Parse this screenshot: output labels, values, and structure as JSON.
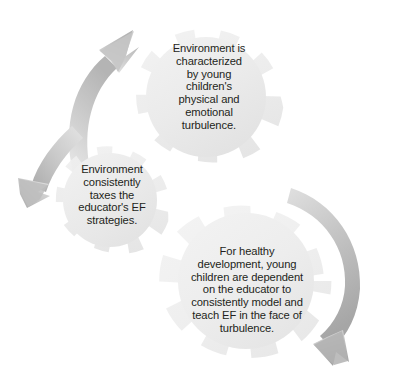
{
  "diagram": {
    "type": "cycle-gears",
    "background_color": "#ffffff",
    "gear_fill_color": "#ececec",
    "gear_fill_light": "#f3f3f3",
    "arrow_color": "#bfbfbf",
    "arrow_color_dark": "#a8a8a8",
    "text_color": "#231f20",
    "gears": [
      {
        "id": "gear-1",
        "name": "environment-characterized-gear",
        "text": "Environment is characterized by young children's physical and emotional turbulence.",
        "lines": "Environment is\ncharacterized\nby young\nchildren's\nphysical and\nemotional\nturbulence.",
        "cx": 206,
        "cy": 97,
        "outer_r": 78,
        "inner_r": 60,
        "teeth": 9,
        "rotation": 8
      },
      {
        "id": "gear-2",
        "name": "environment-taxes-educator-gear",
        "text": "Environment consistently taxes the educator's EF strategies.",
        "lines": "Environment\nconsistently\ntaxes the\neducator's EF\nstrategies.",
        "cx": 110,
        "cy": 200,
        "outer_r": 62,
        "inner_r": 47,
        "teeth": 9,
        "rotation": 20
      },
      {
        "id": "gear-3",
        "name": "healthy-development-dependency-gear",
        "text": "For healthy development, young children are dependent on the educator to consistently model and teach EF in the face of turbulence.",
        "lines": "For healthy\ndevelopment, young\nchildren are dependent\non the educator to\nconsistently model and\nteach EF in the face of\nturbulence.",
        "cx": 246,
        "cy": 281,
        "outer_r": 87,
        "inner_r": 67,
        "teeth": 10,
        "rotation": 0
      }
    ],
    "arrows": [
      {
        "id": "arrow-1",
        "name": "arrow-up-right",
        "direction": "up-right",
        "description": "curved arrow sweeping from lower-left upward to the top gear"
      },
      {
        "id": "arrow-2",
        "name": "arrow-down-left",
        "direction": "down",
        "description": "curved arrow sweeping from upper-right down to the left toward the middle gear"
      },
      {
        "id": "arrow-3",
        "name": "arrow-down-right-sweep",
        "direction": "down-left",
        "description": "large curved arrow sweeping along the right side down to the bottom"
      }
    ]
  }
}
